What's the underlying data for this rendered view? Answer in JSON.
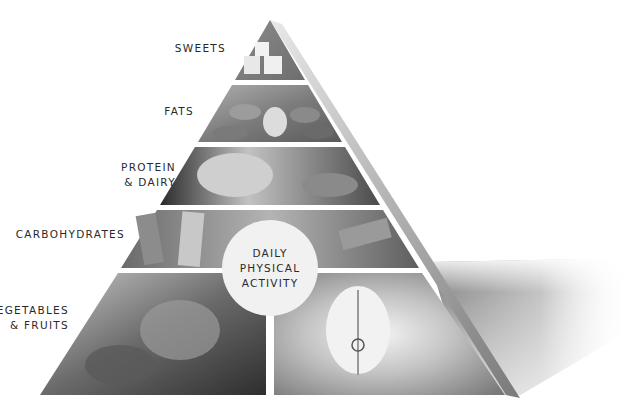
{
  "pyramid": {
    "title": "Food Pyramid",
    "tiers": [
      {
        "label": "SWEETS",
        "image": "sugar-cubes"
      },
      {
        "label": "FATS",
        "image": "almonds"
      },
      {
        "label": "PROTEIN\n& DAIRY",
        "image": "fish"
      },
      {
        "label": "CARBOHYDRATES",
        "image": "penne-pasta"
      },
      {
        "label": "VEGETABLES\n& FRUITS",
        "image": "greens-and-apple"
      }
    ],
    "center_badge": "DAILY\nPHYSICAL\nACTIVITY"
  },
  "colors": {
    "background": "#ffffff",
    "label_text": "#2a2a2a",
    "badge_fill": "#f1f1f1",
    "side_face": "#9a9a9a",
    "shadow": "#b5b5b5"
  }
}
